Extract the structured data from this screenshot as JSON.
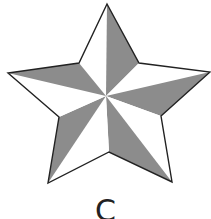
{
  "figure": {
    "label": "C",
    "shape": "five-pointed-star",
    "colors": {
      "light_facet": "#ffffff",
      "dark_facet": "#8c8c8c",
      "outline": "#222222"
    }
  }
}
